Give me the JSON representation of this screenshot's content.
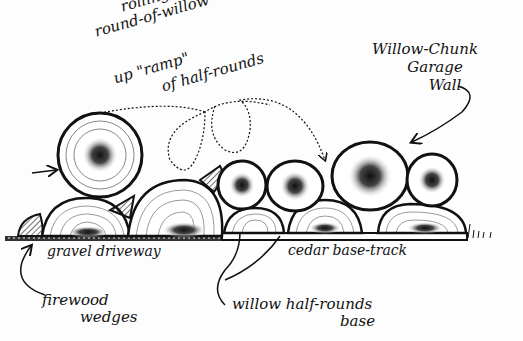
{
  "diagram": {
    "type": "hand-drawn illustration",
    "colors": {
      "ink": "#111111",
      "paper": "#fdfdfd"
    },
    "labels": {
      "rolling": {
        "line1": "rolling a",
        "line2": "round-of-willow",
        "line3": "up \"ramp\"",
        "line4": "of half-rounds"
      },
      "wall": {
        "line1": "Willow-Chunk",
        "line2": "Garage",
        "line3": "Wall"
      },
      "gravel": "gravel driveway",
      "cedar": "cedar base-track",
      "firewood": {
        "line1": "firewood",
        "line2": "wedges"
      },
      "halfrounds": {
        "line1": "willow half-rounds",
        "line2": "base"
      }
    }
  }
}
